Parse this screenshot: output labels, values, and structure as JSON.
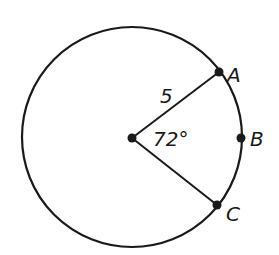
{
  "diagram": {
    "type": "circle-sector",
    "circle": {
      "cx": 132,
      "cy": 137,
      "r": 110
    },
    "center_point": {
      "x": 132,
      "y": 137
    },
    "radius_label": "5",
    "angle_label": "72°",
    "points": [
      {
        "name": "A",
        "x": 219,
        "y": 72,
        "label": "A"
      },
      {
        "name": "B",
        "x": 241,
        "y": 138,
        "label": "B"
      },
      {
        "name": "C",
        "x": 217,
        "y": 205,
        "label": "C"
      }
    ],
    "stroke_color": "#1a1a1a"
  }
}
